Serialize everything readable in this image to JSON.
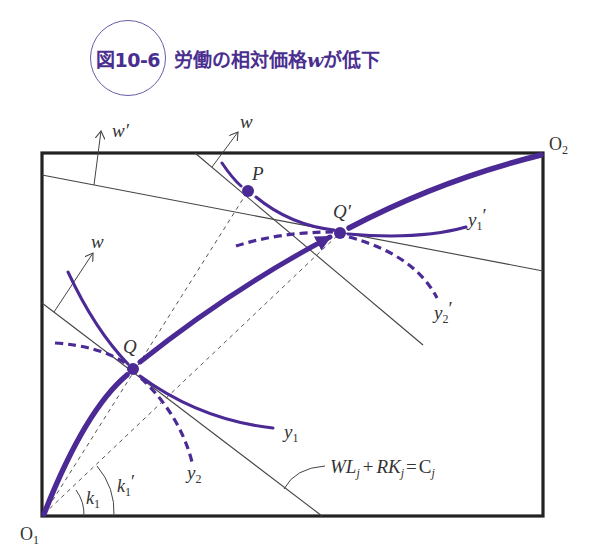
{
  "title": {
    "figure_number": "図10-6",
    "text_before": "労働の相対価格",
    "variable": "w",
    "text_after": "が低下"
  },
  "colors": {
    "curve": "#4b2a95",
    "box": "#222222",
    "line": "#444444",
    "title": "#4a2f8f",
    "title_circle": "#6a5aa8"
  },
  "labels": {
    "origin1": "O",
    "origin1_sub": "1",
    "origin2": "O",
    "origin2_sub": "2",
    "point_q": "Q",
    "point_q_prime": "Q′",
    "point_p": "P",
    "isoquant_y1": "y",
    "isoquant_y1_sub": "1",
    "isoquant_y2": "y",
    "isoquant_y2_sub": "2",
    "isoquant_y1p": "y",
    "isoquant_y1p_sub": "1",
    "isoquant_y2p": "y",
    "isoquant_y2p_sub": "2",
    "prime": "′",
    "wage_w_left": "w",
    "wage_w_top": "w",
    "wage_w_prime": "w′",
    "angle_k1": "k",
    "angle_k1_sub": "1",
    "angle_k1p": "k",
    "angle_k1p_sub": "1",
    "cost_eq": {
      "W": "W",
      "L": "L",
      "j1": "j",
      "plus": "+",
      "R": "R",
      "K": "K",
      "j2": "j",
      "eq": "=",
      "C": "C",
      "j3": "j"
    }
  },
  "geometry": {
    "box": {
      "x1": 42,
      "y1": 153,
      "x2": 543,
      "y2": 516
    },
    "O1": [
      42,
      516
    ],
    "O2": [
      543,
      153
    ],
    "Q": [
      133,
      369
    ],
    "Q_prime": [
      340,
      233
    ],
    "P": [
      248,
      191
    ]
  }
}
